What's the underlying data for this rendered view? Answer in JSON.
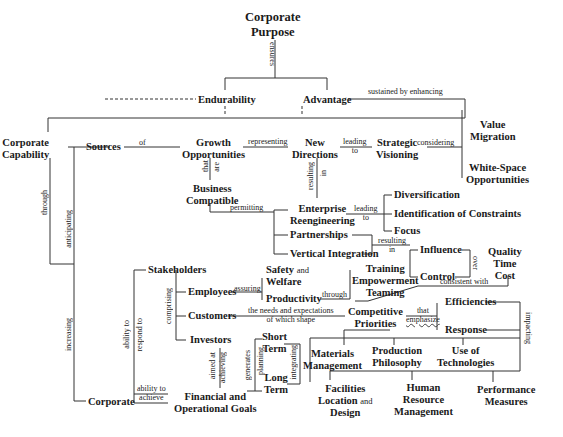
{
  "diagram": {
    "nodes": {
      "corporate_purpose": [
        "Corporate",
        "Purpose"
      ],
      "endurability": "Endurability",
      "advantage": "Advantage",
      "corporate_capability": [
        "Corporate",
        "Capability"
      ],
      "sources": "Sources",
      "growth_opportunities": [
        "Growth",
        "Opportunities"
      ],
      "new_directions": [
        "New",
        "Directions"
      ],
      "strategic_visioning": [
        "Strategic",
        "Visioning"
      ],
      "value_migration": [
        "Value",
        "Migration"
      ],
      "white_space_opportunities": [
        "White-Space",
        "Opportunities"
      ],
      "business_compatible": [
        "Business",
        "Compatible"
      ],
      "enterprise_reengineering": [
        "Enterprise",
        "Reengineering"
      ],
      "partnerships": "Partnerships",
      "vertical_integration": "Vertical Integration",
      "diversification": "Diversification",
      "identification_of_constraints": "Identification of Constraints",
      "focus": "Focus",
      "influence": "Influence",
      "control": "Control",
      "quality_time_cost": [
        "Quality",
        "Time",
        "Cost"
      ],
      "stakeholders": "Stakeholders",
      "employees": "Employees",
      "customers": "Customers",
      "investors": "Investors",
      "safety_and_welfare": [
        "Safety",
        "and",
        "Welfare"
      ],
      "productivity": "Productivity",
      "training_empowerment_teaming": [
        "Training",
        "Empowerment",
        "Teaming"
      ],
      "competitive_priorities": [
        "Competitive",
        "Priorities"
      ],
      "efficiencies": "Efficiencies",
      "response": "Response",
      "short_term": [
        "Short",
        "Term"
      ],
      "long_term": [
        "Long",
        "Term"
      ],
      "materials_management": [
        "Materials",
        "Management"
      ],
      "production_philosophy": [
        "Production",
        "Philosophy"
      ],
      "use_of_technologies": [
        "Use of",
        "Technologies"
      ],
      "corporate": "Corporate",
      "financial_operational_goals": [
        "Financial and",
        "Operational Goals"
      ],
      "facilities_location_design": [
        "Facilities",
        "Location",
        "and",
        "Design"
      ],
      "human_resource_management": [
        "Human",
        "Resource",
        "Management"
      ],
      "performance_measures": [
        "Performance",
        "Measures"
      ]
    },
    "links": {
      "ensures": "ensures",
      "sustained_by_enhancing": "sustained by enhancing",
      "of": "of",
      "representing": "representing",
      "leading_to_1": [
        "leading",
        "to"
      ],
      "considering": "considering",
      "that_are": [
        "that",
        "are"
      ],
      "resulting_in_1": [
        "resulting",
        "in"
      ],
      "permitting": "permitting",
      "leading_to_2": [
        "leading",
        "to"
      ],
      "resulting_in_2": [
        "resulting",
        "in"
      ],
      "over": "over",
      "consistent_with": "consistent with",
      "through_1": "through",
      "anticipating": "anticipating",
      "increasing": "increasing",
      "comprising": "comprising",
      "assuring": "assuring",
      "through_2": "through",
      "needs_expectations": [
        "the needs and expectations",
        "of which shape"
      ],
      "that_emphasize": [
        "that",
        "emphasize"
      ],
      "impacting": "impacting",
      "ability_to_respond_to": [
        "ability to",
        "respond to"
      ],
      "ability_to_achieve": [
        "ability to",
        "achieve"
      ],
      "aimed_at_achieving": [
        "aimed at",
        "achieving"
      ],
      "generates_planning": [
        "generates",
        "planning"
      ],
      "integrating": "integrating"
    }
  }
}
